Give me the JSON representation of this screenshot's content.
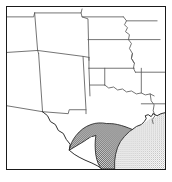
{
  "figure": {
    "name": "locator-map",
    "kind": "reference-locator-map",
    "region_title": "South Central United States",
    "caption": ""
  },
  "frame": {
    "border_color": "#1a1a1a",
    "background_color": "#ffffff",
    "width_px": 160,
    "height_px": 164
  },
  "colors": {
    "state_border": "#5a5a5a",
    "coastline": "#2b2b2b",
    "land_fill": "#ffffff",
    "highlight_fill": "#4d4d4d",
    "water_fill": "#c8c8c8",
    "frame": "#1a1a1a"
  },
  "legend": {
    "highlight_label": "Highlighted study area",
    "water_label": "Gulf of Mexico"
  },
  "states": [
    {
      "id": "utah",
      "label": "Utah"
    },
    {
      "id": "colorado",
      "label": "Colorado"
    },
    {
      "id": "nebraska",
      "label": "Nebraska"
    },
    {
      "id": "iowa",
      "label": "Iowa"
    },
    {
      "id": "arizona",
      "label": "Arizona"
    },
    {
      "id": "new-mexico",
      "label": "New Mexico"
    },
    {
      "id": "kansas",
      "label": "Kansas"
    },
    {
      "id": "missouri",
      "label": "Missouri"
    },
    {
      "id": "oklahoma",
      "label": "Oklahoma"
    },
    {
      "id": "arkansas",
      "label": "Arkansas"
    },
    {
      "id": "texas",
      "label": "Texas"
    },
    {
      "id": "louisiana",
      "label": "Louisiana"
    }
  ],
  "features": {
    "highlight": {
      "name": "texas-gulf-coast-highlight",
      "fill_style": "dark-dither"
    },
    "water": {
      "name": "gulf-of-mexico",
      "fill_style": "light-dither"
    }
  }
}
